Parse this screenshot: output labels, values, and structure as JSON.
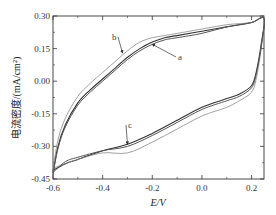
{
  "chart_data": {
    "type": "line",
    "title": "",
    "xlabel": "E/V",
    "ylabel": "电流密度/(mA/cm²)",
    "xlim": [
      -0.6,
      0.25
    ],
    "ylim": [
      -0.45,
      0.3
    ],
    "xticks": [
      -0.6,
      -0.4,
      -0.2,
      0.0,
      0.2
    ],
    "xtick_labels": [
      "-0.6",
      "-0.4",
      "-0.2",
      "0.0",
      "0.2"
    ],
    "yticks": [
      0.3,
      0.15,
      0.0,
      -0.15,
      -0.3,
      -0.45
    ],
    "ytick_labels": [
      "0.30",
      "0.15",
      "0.00",
      "-0.15",
      "-0.30",
      "-0.45"
    ],
    "grid": false,
    "legend": "none (inline arrow annotations a, b, c)",
    "annotations": [
      {
        "text": "a",
        "points_to_x": -0.2,
        "points_to_y": 0.17
      },
      {
        "text": "b",
        "points_to_x": -0.32,
        "points_to_y": 0.13
      },
      {
        "text": "c",
        "points_to_x": -0.3,
        "points_to_y": -0.29
      }
    ],
    "series": [
      {
        "name": "a",
        "x": [
          -0.6,
          -0.58,
          -0.55,
          -0.5,
          -0.45,
          -0.4,
          -0.35,
          -0.3,
          -0.25,
          -0.2,
          -0.15,
          -0.1,
          0.0,
          0.1,
          0.2,
          0.25,
          0.24,
          0.22,
          0.2,
          0.15,
          0.1,
          0.0,
          -0.1,
          -0.2,
          -0.3,
          -0.4,
          -0.5,
          -0.55,
          -0.6
        ],
        "y": [
          -0.42,
          -0.3,
          -0.2,
          -0.1,
          -0.04,
          0.01,
          0.06,
          0.11,
          0.15,
          0.18,
          0.2,
          0.21,
          0.23,
          0.25,
          0.27,
          0.29,
          0.18,
          0.05,
          -0.02,
          -0.06,
          -0.08,
          -0.12,
          -0.18,
          -0.24,
          -0.29,
          -0.32,
          -0.36,
          -0.38,
          -0.41
        ]
      },
      {
        "name": "b",
        "x": [
          -0.6,
          -0.58,
          -0.55,
          -0.5,
          -0.45,
          -0.4,
          -0.35,
          -0.3,
          -0.25,
          -0.2,
          -0.15,
          -0.1,
          0.0,
          0.1,
          0.2,
          0.25,
          0.24,
          0.22,
          0.2,
          0.15,
          0.1,
          0.0,
          -0.1,
          -0.2,
          -0.3,
          -0.4,
          -0.5,
          -0.55,
          -0.6
        ],
        "y": [
          -0.41,
          -0.27,
          -0.17,
          -0.07,
          -0.01,
          0.04,
          0.09,
          0.14,
          0.18,
          0.2,
          0.21,
          0.22,
          0.24,
          0.26,
          0.27,
          0.29,
          0.16,
          0.02,
          -0.05,
          -0.09,
          -0.12,
          -0.16,
          -0.22,
          -0.28,
          -0.33,
          -0.33,
          -0.36,
          -0.38,
          -0.4
        ]
      },
      {
        "name": "c",
        "x": [
          -0.6,
          -0.58,
          -0.55,
          -0.5,
          -0.45,
          -0.4,
          -0.35,
          -0.3,
          -0.25,
          -0.2,
          -0.15,
          -0.1,
          0.0,
          0.1,
          0.2,
          0.25,
          0.24,
          0.22,
          0.2,
          0.15,
          0.1,
          0.0,
          -0.1,
          -0.2,
          -0.3,
          -0.4,
          -0.5,
          -0.55,
          -0.6
        ],
        "y": [
          -0.43,
          -0.31,
          -0.21,
          -0.11,
          -0.05,
          0.0,
          0.05,
          0.1,
          0.14,
          0.17,
          0.19,
          0.2,
          0.22,
          0.25,
          0.27,
          0.29,
          0.17,
          0.04,
          -0.03,
          -0.07,
          -0.09,
          -0.13,
          -0.19,
          -0.25,
          -0.3,
          -0.32,
          -0.35,
          -0.37,
          -0.42
        ]
      }
    ]
  }
}
